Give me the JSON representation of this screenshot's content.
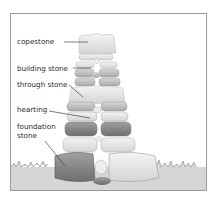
{
  "diagram": {
    "type": "labeled-illustration",
    "labels": [
      {
        "id": "copestone",
        "text": "copestone"
      },
      {
        "id": "building-stone",
        "text": "building stone"
      },
      {
        "id": "through-stone",
        "text": "through stone"
      },
      {
        "id": "hearting",
        "text": "hearting"
      },
      {
        "id": "foundation-stone",
        "line1": "foundation",
        "line2": "stone"
      }
    ],
    "colors": {
      "frame": "#9a9a9a",
      "label_text": "#2a2a2a",
      "leader_line": "#444444",
      "grass": "#c9c9c9",
      "stone_light": "#e6e6e6",
      "stone_mid": "#bdbdbd",
      "stone_dark": "#8c8c8c"
    }
  }
}
